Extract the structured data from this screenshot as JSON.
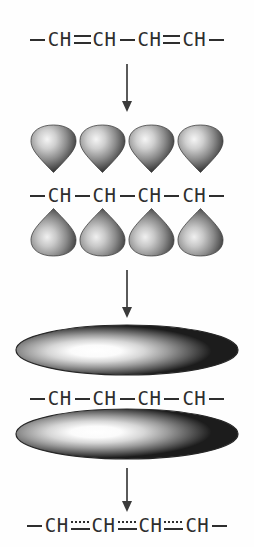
{
  "diagram": {
    "background_color": "#fefefe",
    "ink_color": "#2e2e2e"
  },
  "steps": [
    {
      "id": "step-1-localized",
      "label": "Localized alternating double bonds",
      "formula": {
        "terminal_left": "—",
        "terminal_right": "—",
        "atoms": [
          "CH",
          "CH",
          "CH",
          "CH"
        ],
        "bonds": [
          "double",
          "single",
          "double"
        ],
        "text": "—CH=CH—CH=CH—"
      }
    },
    {
      "id": "step-2-p-orbitals",
      "label": "Parallel p orbitals on each carbon",
      "formula": {
        "terminal_left": "—",
        "terminal_right": "—",
        "atoms": [
          "CH",
          "CH",
          "CH",
          "CH"
        ],
        "bonds": [
          "single",
          "single",
          "single"
        ],
        "text": "—CH—CH—CH—CH—"
      },
      "orbitals": {
        "count_top": 4,
        "count_bottom": 4,
        "shape": "p-orbital-lobe",
        "top_direction": "down",
        "bottom_direction": "up",
        "fill_light": "#f2f2f2",
        "fill_mid": "#9a9a9a",
        "fill_dark": "#3b3b3b"
      }
    },
    {
      "id": "step-3-pi-cloud",
      "label": "Overlapping orbitals form continuous pi clouds",
      "formula": {
        "terminal_left": "—",
        "terminal_right": "—",
        "atoms": [
          "CH",
          "CH",
          "CH",
          "CH"
        ],
        "bonds": [
          "single",
          "single",
          "single"
        ],
        "text": "—CH—CH—CH—CH—"
      },
      "clouds": {
        "count": 2,
        "shape": "flattened-ellipse",
        "positions": [
          "above",
          "below"
        ],
        "fill_light": "#ffffff",
        "fill_mid": "#8e8e8e",
        "fill_dark": "#1f1f1f"
      }
    },
    {
      "id": "step-4-delocalized",
      "label": "Delocalized bonds of intermediate order",
      "formula": {
        "terminal_left": "—",
        "terminal_right": "—",
        "atoms": [
          "CH",
          "CH",
          "CH",
          "CH"
        ],
        "bonds": [
          "partial",
          "partial",
          "partial"
        ],
        "text": "—CH⋯CH⋯CH⋯CH—"
      }
    }
  ],
  "arrows": [
    {
      "id": "arrow-1",
      "direction": "down",
      "icon": "arrow-down-icon"
    },
    {
      "id": "arrow-2",
      "direction": "down",
      "icon": "arrow-down-icon"
    },
    {
      "id": "arrow-3",
      "direction": "down",
      "icon": "arrow-down-icon"
    }
  ]
}
